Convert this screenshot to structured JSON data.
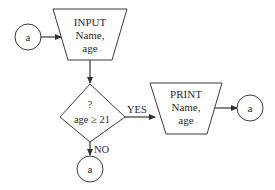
{
  "flowchart": {
    "start_connector": {
      "label": "a"
    },
    "input_box": {
      "line1": "INPUT",
      "line2": "Name,",
      "line3": "age"
    },
    "decision": {
      "line1": "?",
      "line2": "age ≥ 21"
    },
    "yes_label": "YES",
    "no_label": "NO",
    "print_box": {
      "line1": "PRINT",
      "line2": "Name,",
      "line3": "age"
    },
    "yes_connector": {
      "label": "a"
    },
    "no_connector": {
      "label": "a"
    }
  },
  "colors": {
    "stroke": "#3a3a3a",
    "text": "#2a2a2a",
    "background": "#ffffff"
  }
}
